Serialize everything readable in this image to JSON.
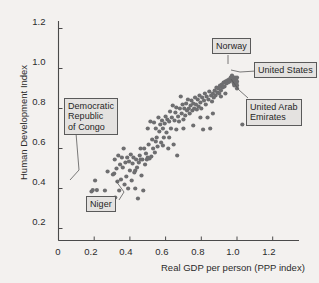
{
  "chart_data": {
    "type": "scatter",
    "title": "",
    "xlabel": "Real GDP per person (PPP index)",
    "ylabel": "Human Development Index",
    "xlim": [
      0,
      1.33
    ],
    "ylim": [
      0,
      1.28
    ],
    "xticks": [
      "0",
      "0.2",
      "0.4",
      "0.6",
      "0.8",
      "1.0",
      "1.2"
    ],
    "xtick_values": [
      0,
      0.2,
      0.4,
      0.6,
      0.8,
      1.0,
      1.2
    ],
    "yticks": [
      "0.2",
      "0.4",
      "0.6",
      "0.8",
      "1.0",
      "1.2"
    ],
    "ytick_values": [
      0.2,
      0.4,
      0.6,
      0.8,
      1.0,
      1.2
    ],
    "grid": false,
    "legend": false,
    "marker_color": "#6e6e70",
    "marker_size": 2.1,
    "points": [
      [
        0.185,
        0.385
      ],
      [
        0.192,
        0.392
      ],
      [
        0.205,
        0.44
      ],
      [
        0.215,
        0.392
      ],
      [
        0.26,
        0.39
      ],
      [
        0.275,
        0.485
      ],
      [
        0.285,
        0.345
      ],
      [
        0.3,
        0.33
      ],
      [
        0.305,
        0.47
      ],
      [
        0.312,
        0.475
      ],
      [
        0.315,
        0.545
      ],
      [
        0.318,
        0.355
      ],
      [
        0.325,
        0.5
      ],
      [
        0.33,
        0.435
      ],
      [
        0.335,
        0.565
      ],
      [
        0.34,
        0.39
      ],
      [
        0.345,
        0.52
      ],
      [
        0.35,
        0.445
      ],
      [
        0.355,
        0.555
      ],
      [
        0.36,
        0.505
      ],
      [
        0.365,
        0.6
      ],
      [
        0.37,
        0.42
      ],
      [
        0.375,
        0.53
      ],
      [
        0.38,
        0.46
      ],
      [
        0.385,
        0.555
      ],
      [
        0.39,
        0.4
      ],
      [
        0.395,
        0.535
      ],
      [
        0.4,
        0.49
      ],
      [
        0.405,
        0.57
      ],
      [
        0.41,
        0.44
      ],
      [
        0.415,
        0.525
      ],
      [
        0.42,
        0.555
      ],
      [
        0.425,
        0.48
      ],
      [
        0.43,
        0.4
      ],
      [
        0.435,
        0.545
      ],
      [
        0.44,
        0.505
      ],
      [
        0.445,
        0.35
      ],
      [
        0.45,
        0.53
      ],
      [
        0.455,
        0.565
      ],
      [
        0.46,
        0.6
      ],
      [
        0.465,
        0.465
      ],
      [
        0.47,
        0.545
      ],
      [
        0.475,
        0.39
      ],
      [
        0.48,
        0.6
      ],
      [
        0.485,
        0.52
      ],
      [
        0.49,
        0.575
      ],
      [
        0.495,
        0.545
      ],
      [
        0.5,
        0.7
      ],
      [
        0.505,
        0.62
      ],
      [
        0.51,
        0.55
      ],
      [
        0.515,
        0.735
      ],
      [
        0.52,
        0.56
      ],
      [
        0.525,
        0.645
      ],
      [
        0.53,
        0.6
      ],
      [
        0.535,
        0.73
      ],
      [
        0.54,
        0.58
      ],
      [
        0.545,
        0.7
      ],
      [
        0.55,
        0.655
      ],
      [
        0.555,
        0.61
      ],
      [
        0.56,
        0.755
      ],
      [
        0.565,
        0.685
      ],
      [
        0.57,
        0.72
      ],
      [
        0.575,
        0.63
      ],
      [
        0.58,
        0.74
      ],
      [
        0.585,
        0.7
      ],
      [
        0.59,
        0.655
      ],
      [
        0.595,
        0.725
      ],
      [
        0.6,
        0.76
      ],
      [
        0.605,
        0.68
      ],
      [
        0.61,
        0.745
      ],
      [
        0.615,
        0.6
      ],
      [
        0.62,
        0.735
      ],
      [
        0.625,
        0.785
      ],
      [
        0.63,
        0.7
      ],
      [
        0.635,
        0.755
      ],
      [
        0.64,
        0.815
      ],
      [
        0.645,
        0.62
      ],
      [
        0.65,
        0.74
      ],
      [
        0.655,
        0.78
      ],
      [
        0.66,
        0.805
      ],
      [
        0.665,
        0.565
      ],
      [
        0.67,
        0.76
      ],
      [
        0.675,
        0.735
      ],
      [
        0.68,
        0.8
      ],
      [
        0.685,
        0.86
      ],
      [
        0.69,
        0.775
      ],
      [
        0.695,
        0.82
      ],
      [
        0.7,
        0.745
      ],
      [
        0.705,
        0.8
      ],
      [
        0.71,
        0.765
      ],
      [
        0.715,
        0.825
      ],
      [
        0.72,
        0.79
      ],
      [
        0.725,
        0.845
      ],
      [
        0.73,
        0.8
      ],
      [
        0.735,
        0.775
      ],
      [
        0.74,
        0.815
      ],
      [
        0.745,
        0.84
      ],
      [
        0.75,
        0.79
      ],
      [
        0.755,
        0.825
      ],
      [
        0.76,
        0.8
      ],
      [
        0.765,
        0.855
      ],
      [
        0.77,
        0.82
      ],
      [
        0.775,
        0.795
      ],
      [
        0.78,
        0.845
      ],
      [
        0.785,
        0.81
      ],
      [
        0.79,
        0.865
      ],
      [
        0.795,
        0.83
      ],
      [
        0.8,
        0.8
      ],
      [
        0.805,
        0.855
      ],
      [
        0.81,
        0.695
      ],
      [
        0.815,
        0.84
      ],
      [
        0.82,
        0.875
      ],
      [
        0.825,
        0.82
      ],
      [
        0.83,
        0.86
      ],
      [
        0.835,
        0.755
      ],
      [
        0.84,
        0.845
      ],
      [
        0.845,
        0.885
      ],
      [
        0.85,
        0.7
      ],
      [
        0.855,
        0.865
      ],
      [
        0.86,
        0.835
      ],
      [
        0.865,
        0.875
      ],
      [
        0.87,
        0.855
      ],
      [
        0.875,
        0.89
      ],
      [
        0.88,
        0.865
      ],
      [
        0.885,
        0.905
      ],
      [
        0.89,
        0.88
      ],
      [
        0.895,
        0.9
      ],
      [
        0.9,
        0.875
      ],
      [
        0.905,
        0.915
      ],
      [
        0.91,
        0.89
      ],
      [
        0.915,
        0.92
      ],
      [
        0.92,
        0.905
      ],
      [
        0.925,
        0.93
      ],
      [
        0.93,
        0.91
      ],
      [
        0.935,
        0.935
      ],
      [
        0.94,
        0.925
      ],
      [
        0.945,
        0.94
      ],
      [
        0.95,
        0.93
      ],
      [
        0.955,
        0.945
      ],
      [
        0.96,
        0.935
      ],
      [
        0.965,
        0.955
      ],
      [
        0.97,
        0.945
      ],
      [
        0.972,
        0.965
      ],
      [
        0.975,
        0.955
      ],
      [
        0.978,
        0.945
      ],
      [
        0.98,
        0.935
      ],
      [
        0.982,
        0.925
      ],
      [
        0.985,
        0.915
      ],
      [
        0.988,
        0.955
      ],
      [
        0.99,
        0.94
      ],
      [
        0.992,
        0.93
      ],
      [
        0.995,
        0.945
      ],
      [
        0.997,
        0.925
      ],
      [
        1.0,
        0.955
      ],
      [
        1.0,
        0.935
      ],
      [
        1.0,
        0.915
      ],
      [
        1.0,
        0.9
      ],
      [
        0.9,
        0.905
      ],
      [
        0.91,
        0.86
      ],
      [
        0.935,
        0.875
      ],
      [
        1.03,
        0.72
      ],
      [
        0.865,
        0.775
      ],
      [
        0.795,
        0.755
      ],
      [
        0.755,
        0.715
      ],
      [
        0.7,
        0.7
      ],
      [
        0.66,
        0.695
      ],
      [
        0.62,
        0.655
      ],
      [
        0.585,
        0.615
      ],
      [
        0.545,
        0.635
      ],
      [
        0.5,
        0.555
      ],
      [
        0.46,
        0.545
      ],
      [
        0.43,
        0.49
      ]
    ],
    "annotations": [
      {
        "name": "democratic-republic-of-congo",
        "label": "Democratic\nRepublic\nof Congo",
        "point": [
          0.185,
          0.385
        ]
      },
      {
        "name": "niger",
        "label": "Niger",
        "point": [
          0.3,
          0.33
        ]
      },
      {
        "name": "norway",
        "label": "Norway",
        "point": [
          0.972,
          0.965
        ]
      },
      {
        "name": "united-states",
        "label": "United States",
        "point": [
          1.0,
          0.94
        ]
      },
      {
        "name": "united-arab-emirates",
        "label": "United Arab\nEmirates",
        "point": [
          1.0,
          0.9
        ]
      }
    ]
  }
}
